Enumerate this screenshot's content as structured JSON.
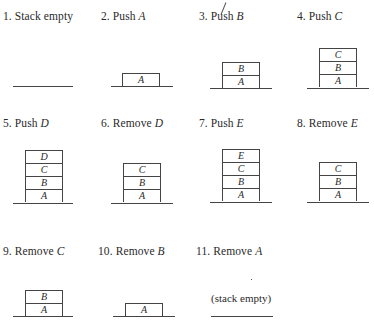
{
  "panels": [
    {
      "step": "1.",
      "action": "Stack empty",
      "symbol": "",
      "stack": []
    },
    {
      "step": "2.",
      "action": "Push",
      "symbol": "A",
      "stack": [
        "A"
      ]
    },
    {
      "step": "3.",
      "action": "Push",
      "symbol": "B",
      "stack": [
        "B",
        "A"
      ]
    },
    {
      "step": "4.",
      "action": "Push",
      "symbol": "C",
      "stack": [
        "C",
        "B",
        "A"
      ]
    },
    {
      "step": "5.",
      "action": "Push",
      "symbol": "D",
      "stack": [
        "D",
        "C",
        "B",
        "A"
      ]
    },
    {
      "step": "6.",
      "action": "Remove",
      "symbol": "D",
      "stack": [
        "C",
        "B",
        "A"
      ]
    },
    {
      "step": "7.",
      "action": "Push",
      "symbol": "E",
      "stack": [
        "E",
        "C",
        "B",
        "A"
      ]
    },
    {
      "step": "8.",
      "action": "Remove",
      "symbol": "E",
      "stack": [
        "C",
        "B",
        "A"
      ]
    },
    {
      "step": "9.",
      "action": "Remove",
      "symbol": "C",
      "stack": [
        "B",
        "A"
      ]
    },
    {
      "step": "10.",
      "action": "Remove",
      "symbol": "B",
      "stack": [
        "A"
      ]
    },
    {
      "step": "11.",
      "action": "Remove",
      "symbol": "A",
      "stack": [],
      "note": "(stack empty)"
    }
  ]
}
